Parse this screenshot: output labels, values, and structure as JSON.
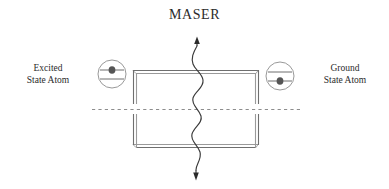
{
  "figure": {
    "title": "MASER",
    "background_color": "#ffffff",
    "ink_color": "#2b2b2b",
    "wall_color": "#8a8a8a",
    "wave_color": "#3a3a3a"
  },
  "labels": {
    "left": {
      "line1": "Excited",
      "line2": "State Atom"
    },
    "right": {
      "line1": "Ground",
      "line2": "State Atom"
    }
  },
  "atoms": {
    "left": {
      "name": "excited-state-atom",
      "center_x": 112,
      "center_y": 74,
      "radius": 14,
      "electron_level": "upper"
    },
    "right": {
      "name": "ground-state-atom",
      "center_x": 280,
      "center_y": 76,
      "radius": 14,
      "electron_level": "lower"
    }
  },
  "cavity": {
    "name": "resonant-cavity",
    "left": 133,
    "right": 258,
    "top": 70,
    "bottom": 148,
    "gap_y": 109
  },
  "axis": {
    "name": "beam-axis",
    "y": 109,
    "x_start": 92,
    "x_end": 303,
    "style": "dashed"
  },
  "wave": {
    "name": "photon-wave",
    "x_center": 197,
    "y_top": 38,
    "y_bottom": 178,
    "arrow_top": "up",
    "arrow_bottom": "down"
  }
}
